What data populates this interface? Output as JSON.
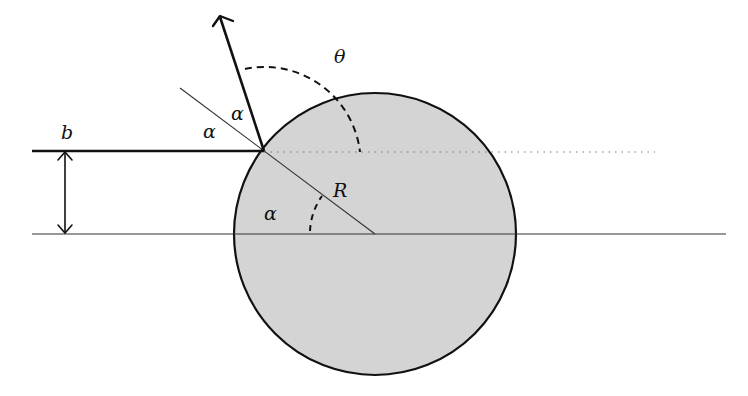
{
  "diagram": {
    "labels": {
      "impact_parameter": "b",
      "radius": "R",
      "scattering_angle": "θ",
      "angle_incident": "α",
      "angle_reflected": "α",
      "angle_center": "α"
    },
    "colors": {
      "sphere_fill": "#d4d4d4",
      "stroke": "#111111",
      "thin_stroke": "#333333",
      "dotted": "#777777",
      "background": "#ffffff"
    },
    "geometry": {
      "sphere_center": [
        375,
        234
      ],
      "sphere_radius": 141,
      "contact_point": [
        264,
        151
      ],
      "arrow_tip": [
        220,
        16
      ]
    }
  }
}
